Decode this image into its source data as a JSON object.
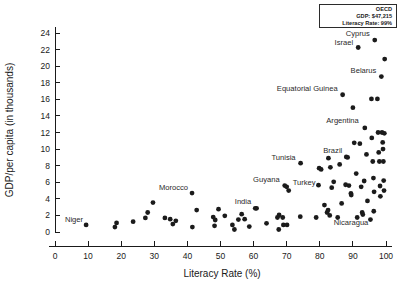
{
  "chart_data": {
    "type": "scatter",
    "title": "",
    "xlabel": "Literacy Rate (%)",
    "ylabel": "GDP/per capita (in thousands)",
    "xlim": [
      0,
      100
    ],
    "ylim": [
      0,
      24
    ],
    "xticks": [
      0,
      10,
      20,
      30,
      40,
      50,
      60,
      70,
      80,
      90,
      100
    ],
    "yticks": [
      0,
      2,
      4,
      6,
      8,
      10,
      12,
      14,
      16,
      18,
      20,
      22,
      24
    ],
    "grid": false,
    "legend_position": "top-right",
    "points": [
      {
        "x": 9.4,
        "y": 0.85,
        "label": "Niger",
        "lx": -3,
        "ly": -3,
        "anchor": "end"
      },
      {
        "x": 18.1,
        "y": 0.6,
        "label": ""
      },
      {
        "x": 18.6,
        "y": 1.1,
        "label": ""
      },
      {
        "x": 23.6,
        "y": 1.25,
        "label": ""
      },
      {
        "x": 27.3,
        "y": 1.7,
        "label": ""
      },
      {
        "x": 28.0,
        "y": 2.35,
        "label": ""
      },
      {
        "x": 29.6,
        "y": 3.55,
        "label": ""
      },
      {
        "x": 33.2,
        "y": 1.7,
        "label": ""
      },
      {
        "x": 34.8,
        "y": 1.55,
        "label": ""
      },
      {
        "x": 35.6,
        "y": 0.95,
        "label": ""
      },
      {
        "x": 36.5,
        "y": 1.35,
        "label": ""
      },
      {
        "x": 41.4,
        "y": 4.7,
        "label": "Morocco",
        "lx": -4,
        "ly": -3,
        "anchor": "end"
      },
      {
        "x": 41.5,
        "y": 0.6,
        "label": ""
      },
      {
        "x": 42.8,
        "y": 2.65,
        "label": ""
      },
      {
        "x": 47.8,
        "y": 1.8,
        "label": ""
      },
      {
        "x": 48.4,
        "y": 1.45,
        "label": ""
      },
      {
        "x": 48.2,
        "y": 0.75,
        "label": ""
      },
      {
        "x": 49.4,
        "y": 2.75,
        "label": ""
      },
      {
        "x": 51.3,
        "y": 1.95,
        "label": ""
      },
      {
        "x": 53.6,
        "y": 0.85,
        "label": ""
      },
      {
        "x": 54.2,
        "y": 0.3,
        "label": ""
      },
      {
        "x": 55.4,
        "y": 1.5,
        "label": ""
      },
      {
        "x": 56.4,
        "y": 2.15,
        "label": ""
      },
      {
        "x": 57.3,
        "y": 1.55,
        "label": ""
      },
      {
        "x": 58.7,
        "y": 0.65,
        "label": ""
      },
      {
        "x": 60.9,
        "y": 2.85,
        "label": ""
      },
      {
        "x": 63.9,
        "y": 1.05,
        "label": ""
      },
      {
        "x": 67.2,
        "y": 1.75,
        "label": ""
      },
      {
        "x": 67.7,
        "y": 2.05,
        "label": ""
      },
      {
        "x": 67.6,
        "y": 0.3,
        "label": ""
      },
      {
        "x": 68.8,
        "y": 1.75,
        "label": ""
      },
      {
        "x": 69.0,
        "y": 0.85,
        "label": ""
      },
      {
        "x": 70.1,
        "y": 0.85,
        "label": ""
      },
      {
        "x": 69.4,
        "y": 5.6,
        "label": "Guyana",
        "lx": -5,
        "ly": -4,
        "anchor": "end"
      },
      {
        "x": 70.0,
        "y": 5.45,
        "label": ""
      },
      {
        "x": 70.6,
        "y": 5.0,
        "label": "Turkey",
        "lx": 4,
        "ly": -6,
        "anchor": "start"
      },
      {
        "x": 74.1,
        "y": 1.85,
        "label": ""
      },
      {
        "x": 74.2,
        "y": 8.3,
        "label": "Tunisia",
        "lx": -5,
        "ly": -3,
        "anchor": "end"
      },
      {
        "x": 78.9,
        "y": 1.75,
        "label": ""
      },
      {
        "x": 79.6,
        "y": 5.65,
        "label": ""
      },
      {
        "x": 79.8,
        "y": 7.7,
        "label": ""
      },
      {
        "x": 80.4,
        "y": 7.55,
        "label": ""
      },
      {
        "x": 81.4,
        "y": 3.25,
        "label": ""
      },
      {
        "x": 82.2,
        "y": 2.35,
        "label": ""
      },
      {
        "x": 82.5,
        "y": 2.65,
        "label": ""
      },
      {
        "x": 82.6,
        "y": 8.9,
        "label": ""
      },
      {
        "x": 83.2,
        "y": 7.8,
        "label": ""
      },
      {
        "x": 83.6,
        "y": 5.35,
        "label": ""
      },
      {
        "x": 83.0,
        "y": 2.0,
        "label": "Nicaragua",
        "lx": 4,
        "ly": 10,
        "anchor": "start"
      },
      {
        "x": 84.2,
        "y": 6.05,
        "label": ""
      },
      {
        "x": 85.4,
        "y": 1.75,
        "label": ""
      },
      {
        "x": 86.0,
        "y": 8.15,
        "label": ""
      },
      {
        "x": 86.6,
        "y": 3.45,
        "label": ""
      },
      {
        "x": 86.9,
        "y": 16.55,
        "label": "Equatorial Guinea",
        "lx": -5,
        "ly": -4,
        "anchor": "end"
      },
      {
        "x": 87.8,
        "y": 5.7,
        "label": ""
      },
      {
        "x": 88.4,
        "y": 9.0,
        "label": ""
      },
      {
        "x": 88.8,
        "y": 5.6,
        "label": ""
      },
      {
        "x": 89.4,
        "y": 4.65,
        "label": ""
      },
      {
        "x": 89.5,
        "y": 4.45,
        "label": ""
      },
      {
        "x": 90.0,
        "y": 15.0,
        "label": ""
      },
      {
        "x": 90.4,
        "y": 10.75,
        "label": ""
      },
      {
        "x": 91.0,
        "y": 7.05,
        "label": ""
      },
      {
        "x": 91.3,
        "y": 1.75,
        "label": ""
      },
      {
        "x": 91.6,
        "y": 22.25,
        "label": "Israel",
        "lx": -5,
        "ly": -3,
        "anchor": "end"
      },
      {
        "x": 92.1,
        "y": 10.65,
        "label": ""
      },
      {
        "x": 92.5,
        "y": 5.45,
        "label": ""
      },
      {
        "x": 92.8,
        "y": 2.35,
        "label": ""
      },
      {
        "x": 93.0,
        "y": 2.1,
        "label": ""
      },
      {
        "x": 93.4,
        "y": 6.15,
        "label": ""
      },
      {
        "x": 93.6,
        "y": 12.55,
        "label": "Argentina",
        "lx": -6,
        "ly": -5,
        "anchor": "end"
      },
      {
        "x": 94.1,
        "y": 9.35,
        "label": ""
      },
      {
        "x": 94.4,
        "y": 3.75,
        "label": ""
      },
      {
        "x": 95.3,
        "y": 1.5,
        "label": ""
      },
      {
        "x": 95.6,
        "y": 16.05,
        "label": ""
      },
      {
        "x": 95.7,
        "y": 11.35,
        "label": ""
      },
      {
        "x": 96.0,
        "y": 8.5,
        "label": ""
      },
      {
        "x": 96.2,
        "y": 6.5,
        "label": ""
      },
      {
        "x": 96.4,
        "y": 4.85,
        "label": ""
      },
      {
        "x": 96.3,
        "y": 2.5,
        "label": ""
      },
      {
        "x": 96.6,
        "y": 23.15,
        "label": "Cyprus",
        "lx": -5,
        "ly": -4,
        "anchor": "end"
      },
      {
        "x": 97.4,
        "y": 16.05,
        "label": ""
      },
      {
        "x": 97.6,
        "y": 12.0,
        "label": ""
      },
      {
        "x": 97.8,
        "y": 9.6,
        "label": ""
      },
      {
        "x": 98.0,
        "y": 8.5,
        "label": ""
      },
      {
        "x": 98.2,
        "y": 5.55,
        "label": ""
      },
      {
        "x": 98.3,
        "y": 4.3,
        "label": ""
      },
      {
        "x": 98.6,
        "y": 18.75,
        "label": "Belarus",
        "lx": -5,
        "ly": -4,
        "anchor": "end"
      },
      {
        "x": 98.8,
        "y": 12.0,
        "label": ""
      },
      {
        "x": 99.0,
        "y": 10.8,
        "label": ""
      },
      {
        "x": 99.1,
        "y": 10.0,
        "label": ""
      },
      {
        "x": 99.2,
        "y": 8.5,
        "label": ""
      },
      {
        "x": 99.3,
        "y": 6.2,
        "label": ""
      },
      {
        "x": 99.4,
        "y": 5.0,
        "label": ""
      },
      {
        "x": 99.6,
        "y": 20.85,
        "label": ""
      },
      {
        "x": 99.5,
        "y": 11.9,
        "label": ""
      },
      {
        "x": 60.5,
        "y": 2.85,
        "label": "India",
        "lx": -4,
        "ly": -4,
        "anchor": "end"
      },
      {
        "x": 88.0,
        "y": 9.05,
        "label": "Brazil",
        "lx": -4,
        "ly": -4,
        "anchor": "end"
      }
    ]
  },
  "legend": {
    "title": "OECD",
    "gdp_label": "GDP: $47,215",
    "literacy_label": "Literacy Rate: 99%"
  }
}
